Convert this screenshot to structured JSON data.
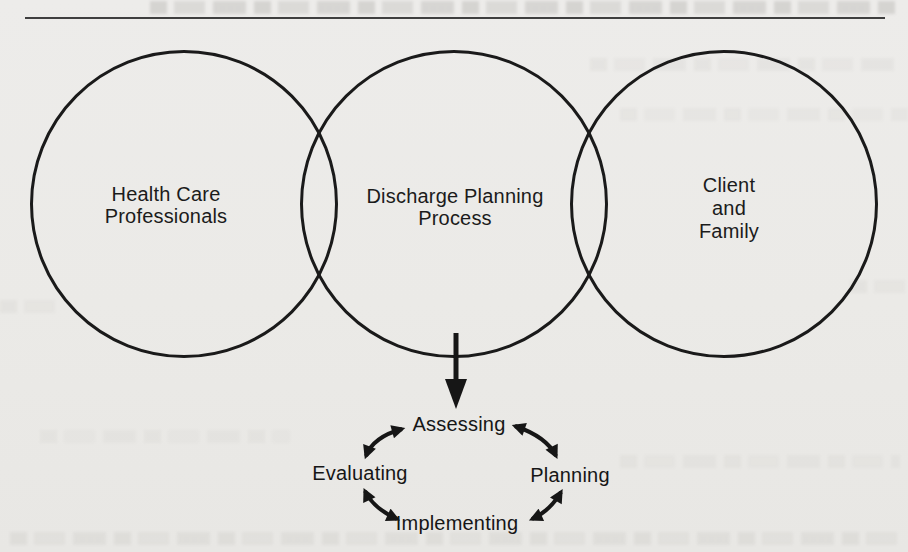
{
  "page": {
    "paper_color": "#EBEAE7",
    "ink_color": "#1A1A1A",
    "rule_color": "#3F3F3F"
  },
  "diagram": {
    "circles": [
      {
        "label": "Health Care\nProfessionals"
      },
      {
        "label": "Discharge Planning\nProcess"
      },
      {
        "label": "Client\nand\nFamily"
      }
    ],
    "cycle": {
      "steps": [
        "Assessing",
        "Planning",
        "Implementing",
        "Evaluating"
      ]
    }
  }
}
